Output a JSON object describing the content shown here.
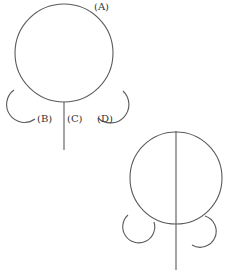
{
  "figure_top": {
    "description": "Circle with a downward stem and two side hooks, labeled parts",
    "labels": {
      "a": "(A)",
      "b": "(B)",
      "c": "(C)",
      "d": "(D)"
    },
    "stroke_color": "#5a5a5a"
  },
  "figure_bottom": {
    "description": "Circle bisected by a vertical line with two curled hooks at the bottom",
    "stroke_color": "#5a5a5a"
  }
}
